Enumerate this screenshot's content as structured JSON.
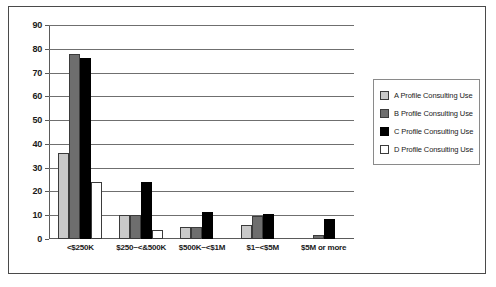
{
  "chart_data": {
    "type": "bar",
    "title": "",
    "xlabel": "",
    "ylabel": "",
    "ylim": [
      0,
      90
    ],
    "ytick_step": 10,
    "yticks": [
      0,
      10,
      20,
      30,
      40,
      50,
      60,
      70,
      80,
      90
    ],
    "grid": true,
    "legend_position": "right",
    "categories": [
      "<$250K",
      "$250~<&500K",
      "$500K~<$1M",
      "$1~<$5M",
      "$5M or more"
    ],
    "series": [
      {
        "name": "A Profile Consulting Use",
        "color": "#c9c9c9",
        "values": [
          36,
          10,
          5,
          6,
          0
        ]
      },
      {
        "name": "B Profile Consulting Use",
        "color": "#6e6e6e",
        "values": [
          78,
          10,
          5,
          9.5,
          1.5
        ]
      },
      {
        "name": "C Profile Consulting Use",
        "color": "#000000",
        "values": [
          76,
          24,
          11.5,
          10.5,
          8.5
        ]
      },
      {
        "name": "D Profile Consulting Use",
        "color": "#ffffff",
        "values": [
          24,
          4,
          0,
          0,
          0
        ]
      }
    ]
  }
}
